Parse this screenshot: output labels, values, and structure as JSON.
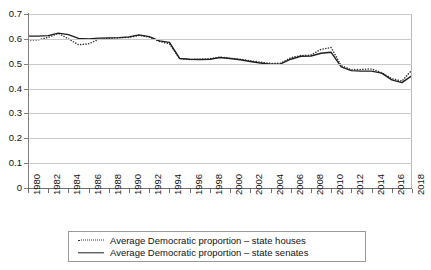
{
  "chart_data": {
    "type": "line",
    "title": "",
    "xlabel": "",
    "ylabel": "",
    "xlim": [
      1980,
      2018
    ],
    "ylim": [
      0,
      0.7
    ],
    "grid": true,
    "legend_position": "bottom",
    "y_ticks": [
      "0",
      "0.1",
      "0.2",
      "0.3",
      "0.4",
      "0.5",
      "0.6",
      "0.7"
    ],
    "y_tick_values": [
      0,
      0.1,
      0.2,
      0.3,
      0.4,
      0.5,
      0.6,
      0.7
    ],
    "x_ticks": [
      "1980",
      "1982",
      "1984",
      "1986",
      "1988",
      "1990",
      "1992",
      "1994",
      "1996",
      "1998",
      "2000",
      "2002",
      "2004",
      "2006",
      "2008",
      "2010",
      "2012",
      "2014",
      "2016",
      "2018"
    ],
    "x_tick_values": [
      1980,
      1982,
      1984,
      1986,
      1988,
      1990,
      1992,
      1994,
      1996,
      1998,
      2000,
      2002,
      2004,
      2006,
      2008,
      2010,
      2012,
      2014,
      2016,
      2018
    ],
    "x": [
      1980,
      1981,
      1982,
      1983,
      1984,
      1985,
      1986,
      1987,
      1988,
      1989,
      1990,
      1991,
      1992,
      1993,
      1994,
      1995,
      1996,
      1997,
      1998,
      1999,
      2000,
      2001,
      2002,
      2003,
      2004,
      2005,
      2006,
      2007,
      2008,
      2009,
      2010,
      2011,
      2012,
      2013,
      2014,
      2015,
      2016,
      2017,
      2018
    ],
    "series": [
      {
        "name": "Average Democratic proportion – state houses",
        "style": "dotted",
        "color": "#333333",
        "values": [
          0.595,
          0.596,
          0.606,
          0.622,
          0.6,
          0.576,
          0.58,
          0.598,
          0.602,
          0.604,
          0.606,
          0.614,
          0.607,
          0.59,
          0.58,
          0.521,
          0.517,
          0.518,
          0.52,
          0.527,
          0.522,
          0.518,
          0.512,
          0.506,
          0.501,
          0.502,
          0.524,
          0.533,
          0.535,
          0.558,
          0.565,
          0.492,
          0.476,
          0.477,
          0.479,
          0.464,
          0.44,
          0.43,
          0.475
        ]
      },
      {
        "name": "Average Democratic proportion – state senates",
        "style": "solid",
        "color": "#1f1f1f",
        "values": [
          0.611,
          0.611,
          0.613,
          0.623,
          0.617,
          0.602,
          0.6,
          0.603,
          0.604,
          0.605,
          0.608,
          0.616,
          0.609,
          0.592,
          0.586,
          0.521,
          0.518,
          0.517,
          0.518,
          0.525,
          0.521,
          0.516,
          0.509,
          0.503,
          0.498,
          0.499,
          0.518,
          0.53,
          0.531,
          0.542,
          0.546,
          0.487,
          0.472,
          0.47,
          0.47,
          0.462,
          0.435,
          0.424,
          0.452
        ]
      }
    ]
  },
  "legend": {
    "items": [
      {
        "label": "Average Democratic proportion – state houses",
        "style": "dotted"
      },
      {
        "label": "Average Democratic proportion – state senates",
        "style": "solid"
      }
    ]
  }
}
